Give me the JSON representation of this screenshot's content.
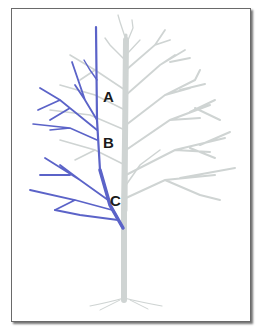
{
  "diagram": {
    "colors": {
      "highlight_branch": "#5b63c8",
      "tree": "#cfd4d3",
      "frame_border": "#6a6a6a",
      "label": "#1a1a1a"
    },
    "labels": [
      {
        "id": "A",
        "text": "A"
      },
      {
        "id": "B",
        "text": "B"
      },
      {
        "id": "C",
        "text": "C"
      }
    ]
  }
}
